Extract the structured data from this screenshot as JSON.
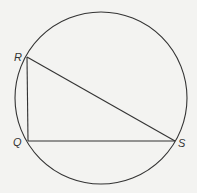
{
  "diagram": {
    "type": "circle with inscribed right triangle",
    "circle": {
      "cx": 101,
      "cy": 98,
      "r": 86
    },
    "points": [
      {
        "label": "R",
        "x": 27,
        "y": 57,
        "lx": 14,
        "ly": 60
      },
      {
        "label": "Q",
        "x": 28,
        "y": 141,
        "lx": 13,
        "ly": 146
      },
      {
        "label": "S",
        "x": 175,
        "y": 141,
        "lx": 178,
        "ly": 147
      }
    ],
    "segments": [
      [
        "R",
        "Q"
      ],
      [
        "Q",
        "S"
      ],
      [
        "R",
        "S"
      ]
    ],
    "colors": {
      "stroke": "#333333",
      "background": "#f3f3f1"
    }
  }
}
